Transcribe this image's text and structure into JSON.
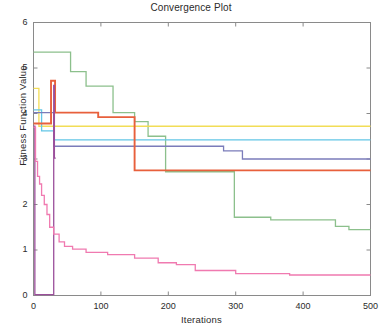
{
  "chart_data": {
    "type": "line",
    "title": "Convergence Plot",
    "xlabel": "Iterations",
    "ylabel": "Fitness Function Value",
    "xlim": [
      0,
      500
    ],
    "ylim": [
      0,
      6
    ],
    "xticks": [
      0,
      100,
      200,
      300,
      400,
      500
    ],
    "yticks": [
      0,
      1,
      2,
      3,
      4,
      5,
      6
    ],
    "grid": false,
    "legend": "none",
    "series": [
      {
        "name": "green",
        "color": "#8cc08c",
        "points": [
          [
            0,
            5.35
          ],
          [
            55,
            5.35
          ],
          [
            55,
            4.92
          ],
          [
            78,
            4.92
          ],
          [
            78,
            4.6
          ],
          [
            118,
            4.6
          ],
          [
            118,
            4.02
          ],
          [
            150,
            4.02
          ],
          [
            150,
            3.82
          ],
          [
            170,
            3.82
          ],
          [
            170,
            3.5
          ],
          [
            196,
            3.5
          ],
          [
            196,
            2.72
          ],
          [
            298,
            2.72
          ],
          [
            298,
            1.72
          ],
          [
            352,
            1.72
          ],
          [
            352,
            1.66
          ],
          [
            448,
            1.66
          ],
          [
            448,
            1.52
          ],
          [
            468,
            1.52
          ],
          [
            468,
            1.45
          ],
          [
            500,
            1.45
          ]
        ]
      },
      {
        "name": "yellow",
        "color": "#f2dd57",
        "points": [
          [
            0,
            4.55
          ],
          [
            8,
            4.55
          ],
          [
            8,
            3.72
          ],
          [
            500,
            3.72
          ]
        ]
      },
      {
        "name": "cyan",
        "color": "#63c6e6",
        "points": [
          [
            0,
            4.08
          ],
          [
            12,
            4.08
          ],
          [
            12,
            3.62
          ],
          [
            30,
            3.62
          ],
          [
            30,
            3.42
          ],
          [
            500,
            3.42
          ]
        ]
      },
      {
        "name": "slate-blue",
        "color": "#7b7cba",
        "points": [
          [
            0,
            4.02
          ],
          [
            30,
            4.02
          ],
          [
            30,
            3.28
          ],
          [
            282,
            3.28
          ],
          [
            282,
            3.18
          ],
          [
            310,
            3.18
          ],
          [
            310,
            3.0
          ],
          [
            500,
            3.0
          ]
        ]
      },
      {
        "name": "orange-red",
        "color": "#e8603c",
        "points": [
          [
            0,
            3.78
          ],
          [
            26,
            3.78
          ],
          [
            26,
            4.72
          ],
          [
            32,
            4.72
          ],
          [
            32,
            4.02
          ],
          [
            96,
            4.02
          ],
          [
            96,
            3.92
          ],
          [
            150,
            3.92
          ],
          [
            150,
            2.75
          ],
          [
            500,
            2.75
          ]
        ]
      },
      {
        "name": "magenta-drop",
        "color": "#9b4f9b",
        "points": [
          [
            0,
            3.72
          ],
          [
            2,
            3.72
          ],
          [
            2,
            0.02
          ],
          [
            30,
            0.02
          ],
          [
            30,
            4.62
          ],
          [
            31,
            4.62
          ],
          [
            31,
            3.02
          ],
          [
            33,
            3.02
          ]
        ]
      },
      {
        "name": "pink",
        "color": "#f07ab0",
        "points": [
          [
            0,
            3.7
          ],
          [
            3,
            3.7
          ],
          [
            3,
            2.95
          ],
          [
            6,
            2.95
          ],
          [
            6,
            2.62
          ],
          [
            9,
            2.62
          ],
          [
            9,
            2.45
          ],
          [
            12,
            2.45
          ],
          [
            12,
            2.2
          ],
          [
            16,
            2.2
          ],
          [
            16,
            2.0
          ],
          [
            20,
            2.0
          ],
          [
            20,
            1.78
          ],
          [
            24,
            1.78
          ],
          [
            24,
            1.5
          ],
          [
            30,
            1.5
          ],
          [
            30,
            1.35
          ],
          [
            38,
            1.35
          ],
          [
            38,
            1.18
          ],
          [
            46,
            1.18
          ],
          [
            46,
            1.08
          ],
          [
            58,
            1.08
          ],
          [
            58,
            1.02
          ],
          [
            78,
            1.02
          ],
          [
            78,
            0.95
          ],
          [
            110,
            0.95
          ],
          [
            110,
            0.9
          ],
          [
            150,
            0.9
          ],
          [
            150,
            0.82
          ],
          [
            185,
            0.82
          ],
          [
            185,
            0.72
          ],
          [
            212,
            0.72
          ],
          [
            212,
            0.68
          ],
          [
            240,
            0.68
          ],
          [
            240,
            0.55
          ],
          [
            300,
            0.55
          ],
          [
            300,
            0.48
          ],
          [
            380,
            0.48
          ],
          [
            380,
            0.45
          ],
          [
            500,
            0.45
          ]
        ]
      }
    ]
  },
  "axes": {
    "frame_color": "#8a8a8a",
    "tick_color": "#8a8a8a",
    "y_tick_labels": [
      "6",
      "5",
      "4",
      "3",
      "2",
      "1",
      "0"
    ],
    "x_tick_labels": [
      "0",
      "100",
      "200",
      "300",
      "400",
      "500"
    ]
  }
}
